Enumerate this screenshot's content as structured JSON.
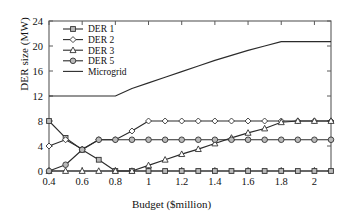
{
  "chart_data": {
    "type": "line",
    "title": "",
    "xlabel": "Budget ($million)",
    "ylabel": "DER size (MW)",
    "xlim": [
      0.4,
      2.1
    ],
    "ylim": [
      0,
      24
    ],
    "xticks": [
      "0.4",
      "0.6",
      "0.8",
      "1",
      "1.2",
      "1.4",
      "1.6",
      "1.8",
      "2"
    ],
    "xtick_values": [
      0.4,
      0.6,
      0.8,
      1.0,
      1.2,
      1.4,
      1.6,
      1.8,
      2.0
    ],
    "yticks": [
      "0",
      "4",
      "8",
      "12",
      "16",
      "20",
      "24"
    ],
    "ytick_values": [
      0,
      4,
      8,
      12,
      16,
      20,
      24
    ],
    "grid": false,
    "legend_position": "top-left",
    "x": [
      0.4,
      0.5,
      0.6,
      0.7,
      0.8,
      0.9,
      1.0,
      1.1,
      1.2,
      1.3,
      1.4,
      1.5,
      1.6,
      1.7,
      1.8,
      1.9,
      2.0,
      2.1
    ],
    "series": [
      {
        "name": "DER 1",
        "marker": "square",
        "values": [
          8.0,
          5.3,
          3.4,
          1.8,
          0.0,
          0.0,
          0.0,
          0.0,
          0.0,
          0.0,
          0.0,
          0.0,
          0.0,
          0.0,
          0.0,
          0.0,
          0.0,
          0.0
        ]
      },
      {
        "name": "DER 2",
        "marker": "diamond",
        "values": [
          4.0,
          5.0,
          3.5,
          5.0,
          5.0,
          6.4,
          8.0,
          8.0,
          8.0,
          8.0,
          8.0,
          8.0,
          8.0,
          8.0,
          8.0,
          8.0,
          8.0,
          8.0
        ]
      },
      {
        "name": "DER 3",
        "marker": "triangle",
        "values": [
          0.0,
          0.0,
          0.0,
          0.0,
          0.0,
          0.0,
          0.9,
          1.8,
          2.7,
          3.5,
          4.4,
          5.3,
          6.1,
          6.8,
          7.8,
          8.0,
          8.0,
          8.0
        ]
      },
      {
        "name": "DER 5",
        "marker": "circle",
        "values": [
          0.0,
          1.0,
          3.4,
          5.0,
          5.0,
          5.0,
          5.0,
          5.0,
          5.0,
          5.0,
          5.0,
          5.0,
          5.0,
          5.0,
          5.0,
          5.0,
          5.0,
          5.0
        ]
      },
      {
        "name": "Microgrid",
        "marker": "none",
        "values": [
          12.0,
          12.0,
          12.0,
          12.0,
          12.0,
          13.2,
          14.1,
          15.0,
          15.9,
          16.8,
          17.7,
          18.5,
          19.3,
          20.0,
          20.7,
          20.7,
          20.7,
          20.7
        ]
      }
    ]
  },
  "legend": {
    "items": [
      {
        "label": "DER 1",
        "marker": "square"
      },
      {
        "label": "DER 2",
        "marker": "diamond"
      },
      {
        "label": "DER 3",
        "marker": "triangle"
      },
      {
        "label": "DER 5",
        "marker": "circle"
      },
      {
        "label": "Microgrid",
        "marker": "none"
      }
    ]
  },
  "colors": {
    "axis": "#5a5a5a",
    "line": "#2b2b2b",
    "marker_fill": "#b9b9b9",
    "marker_edge": "#333333",
    "background": "#ffffff"
  }
}
